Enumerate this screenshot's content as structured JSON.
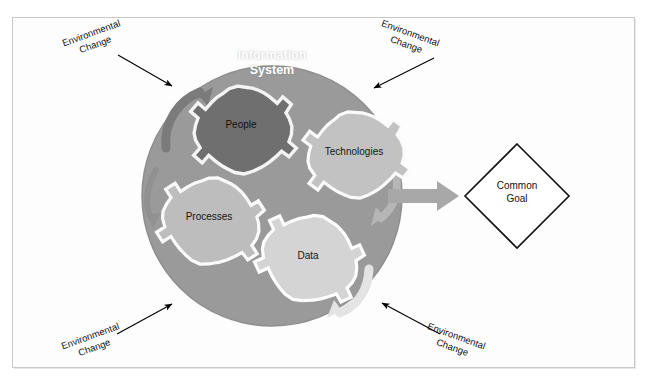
{
  "figure": {
    "caption_strip": "",
    "title": "Information System",
    "frame_color": "#c9c9c9",
    "background": "#ffffff"
  },
  "system_circle": {
    "label": "Information\nSystem",
    "label_color": "#ffffff",
    "fill": "#9a9a9a",
    "center_x": 272,
    "center_y": 196,
    "radius": 130
  },
  "gears": [
    {
      "id": "people",
      "label": "People",
      "fill": "#6e6e6e",
      "stroke": "#f2f2f2",
      "text_color": "#111111",
      "cx": 241,
      "cy": 130,
      "radius": 44
    },
    {
      "id": "technologies",
      "label": "Technologies",
      "fill": "#c0c0c0",
      "stroke": "#fafafa",
      "text_color": "#141414",
      "cx": 354,
      "cy": 155,
      "radius": 43
    },
    {
      "id": "processes",
      "label": "Processes",
      "fill": "#bdbdbd",
      "stroke": "#fafafa",
      "text_color": "#141414",
      "cx": 209,
      "cy": 221,
      "radius": 44
    },
    {
      "id": "data",
      "label": "Data",
      "fill": "#d2d2d2",
      "stroke": "#fcfcfc",
      "text_color": "#141414",
      "cx": 308,
      "cy": 258,
      "radius": 44
    }
  ],
  "rotation_arrows": [
    {
      "id": "top-left-rotation",
      "color": "#7d7d7d",
      "direction": "clockwise-up-right"
    },
    {
      "id": "left-rotation",
      "color": "#8f8f8f",
      "direction": "down"
    },
    {
      "id": "right-rotation",
      "color": "#b4b4b4",
      "direction": "down-left"
    },
    {
      "id": "bottom-rotation",
      "color": "#e3e3e3",
      "direction": "down-left"
    }
  ],
  "output_arrow": {
    "label": "",
    "color": "#a6a6a6",
    "direction": "right"
  },
  "goal": {
    "label": "Common\nGoal",
    "stroke": "#111111",
    "fill": "#ffffff",
    "cx": 517,
    "cy": 196,
    "half_width": 52,
    "half_height": 52
  },
  "environmental_changes": [
    {
      "id": "top-left",
      "label": "Environmental\nChange",
      "rotation_deg": -20,
      "arrow_color": "#000000"
    },
    {
      "id": "top-right",
      "label": "Environmental\nChange",
      "rotation_deg": 20,
      "arrow_color": "#000000"
    },
    {
      "id": "bottom-left",
      "label": "Environmental\nChange",
      "rotation_deg": -20,
      "arrow_color": "#000000"
    },
    {
      "id": "bottom-right",
      "label": "Environmental\nChange",
      "rotation_deg": 20,
      "arrow_color": "#000000"
    }
  ]
}
